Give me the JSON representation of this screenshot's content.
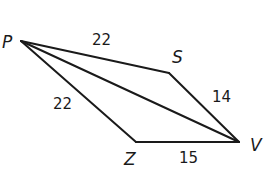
{
  "diagram": {
    "vertices": [
      {
        "id": "P",
        "label": "P"
      },
      {
        "id": "S",
        "label": "S"
      },
      {
        "id": "V",
        "label": "V"
      },
      {
        "id": "Z",
        "label": "Z"
      }
    ],
    "edges": [
      {
        "from": "P",
        "to": "S",
        "label": "22"
      },
      {
        "from": "S",
        "to": "V",
        "label": "14"
      },
      {
        "from": "Z",
        "to": "V",
        "label": "15"
      },
      {
        "from": "P",
        "to": "Z",
        "label": "22"
      },
      {
        "from": "P",
        "to": "V",
        "label": ""
      }
    ]
  }
}
